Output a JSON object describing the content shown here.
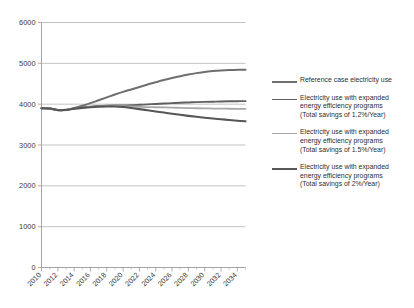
{
  "chart_data": {
    "type": "line",
    "title": "",
    "subtitle": "",
    "xlabel": "",
    "ylabel": "",
    "xlim": [
      2010,
      2035
    ],
    "ylim": [
      0,
      6000
    ],
    "grid": true,
    "legend_position": "right",
    "x": [
      2010,
      2011,
      2012,
      2013,
      2014,
      2015,
      2016,
      2017,
      2018,
      2019,
      2020,
      2021,
      2022,
      2023,
      2024,
      2025,
      2026,
      2027,
      2028,
      2029,
      2030,
      2031,
      2032,
      2033,
      2034,
      2035
    ],
    "x_tick_labels": [
      "2010",
      "2012",
      "2014",
      "2016",
      "2018",
      "2020",
      "2022",
      "2024",
      "2026",
      "2028",
      "2030",
      "2032",
      "2034"
    ],
    "y_tick_labels": [
      "0",
      "1000",
      "2000",
      "3000",
      "4000",
      "5000",
      "6000"
    ],
    "y_ticks": [
      0,
      1000,
      2000,
      3000,
      4000,
      5000,
      6000
    ],
    "series": [
      {
        "name": "Reference case electricity use",
        "color": "#6e6e6e",
        "width": 2.0,
        "values": [
          3900,
          3895,
          3855,
          3860,
          3905,
          3960,
          4025,
          4095,
          4165,
          4235,
          4300,
          4360,
          4420,
          4480,
          4535,
          4590,
          4640,
          4685,
          4725,
          4760,
          4790,
          4810,
          4825,
          4835,
          4840,
          4845
        ]
      },
      {
        "name": "Electricity use with expanded energy efficiency programs (Total savings of 1.2%/Year)",
        "color": "#5f5f5f",
        "width": 1.9,
        "values": [
          3900,
          3895,
          3855,
          3860,
          3895,
          3920,
          3940,
          3955,
          3965,
          3970,
          3970,
          3975,
          3985,
          3995,
          4005,
          4015,
          4025,
          4035,
          4042,
          4050,
          4056,
          4061,
          4066,
          4070,
          4073,
          4075
        ]
      },
      {
        "name": "Electricity use with expanded energy efficiency programs (Total savings of 1.5%/Year)",
        "color": "#a8a8a8",
        "width": 1.8,
        "values": [
          3900,
          3895,
          3855,
          3860,
          3890,
          3912,
          3930,
          3944,
          3952,
          3955,
          3950,
          3943,
          3936,
          3930,
          3925,
          3920,
          3915,
          3910,
          3905,
          3900,
          3896,
          3893,
          3890,
          3888,
          3886,
          3885
        ]
      },
      {
        "name": "Electricity use with expanded energy efficiency programs (Total savings of 2%/Year)",
        "color": "#565656",
        "width": 2.1,
        "values": [
          3900,
          3895,
          3855,
          3860,
          3888,
          3908,
          3925,
          3937,
          3944,
          3944,
          3930,
          3905,
          3878,
          3850,
          3822,
          3794,
          3766,
          3740,
          3714,
          3690,
          3668,
          3648,
          3630,
          3612,
          3595,
          3580
        ]
      }
    ],
    "annotations": []
  },
  "legend": {
    "entries": [
      {
        "label": "Reference case electricity use",
        "color": "#6e6e6e",
        "width": 2.0
      },
      {
        "label": "Electricity use with expanded\nenergy efficiency programs\n(Total savings of 1.2%/Year)",
        "color": "#5f5f5f",
        "width": 1.9
      },
      {
        "label": "Electricity use with expanded\nenergy efficiency programs\n(Total savings of 1.5%/Year)",
        "color": "#a8a8a8",
        "width": 1.8
      },
      {
        "label": "Electricity use with expanded\nenergy efficiency programs\n(Total savings of 2%/Year)",
        "color": "#565656",
        "width": 2.1
      }
    ]
  },
  "colors": {
    "axis": "#9a9a9a",
    "grid": "#b4b4b4",
    "text": "#333333",
    "background": "#ffffff"
  }
}
